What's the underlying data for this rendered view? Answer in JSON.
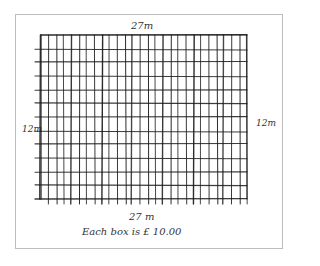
{
  "diagram": {
    "title_top": "27m",
    "title_bottom": "27 m",
    "side_left": "12m",
    "side_right": "12m",
    "caption": "Each box is £ 10.00",
    "grid": {
      "columns": 27,
      "rows": 12,
      "line_color": "#1a1a1a",
      "frame_color": "#bdbdbd"
    }
  }
}
